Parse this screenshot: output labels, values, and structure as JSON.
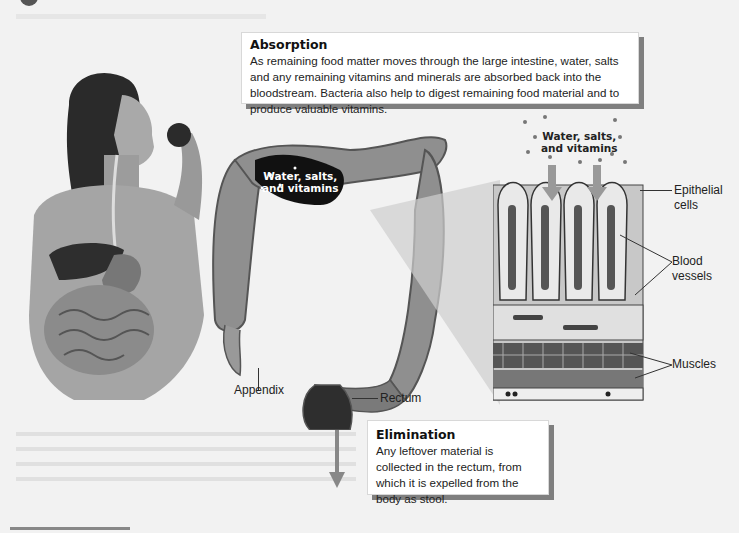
{
  "figure": {
    "absorption": {
      "title": "Absorption",
      "body": "As remaining food matter moves through the large intestine, water, salts and any remaining vitamins and minerals are absorbed back into the bloodstream. Bacteria also help to digest remaining food material and to produce valuable vitamins."
    },
    "elimination": {
      "title": "Elimination",
      "body": "Any leftover material is collected in the rectum, from which it is expelled from the body as stool."
    },
    "labels": {
      "colon_inside": "Water, salts, and vitamins",
      "tissue_top_line1": "Water, salts,",
      "tissue_top_line2": "and vitamins",
      "colon_line1": "Water, salts,",
      "colon_line2": "and vitamins",
      "epithelial_line1": "Epithelial",
      "epithelial_line2": "cells",
      "blood_line1": "Blood",
      "blood_line2": "vessels",
      "muscles": "Muscles",
      "appendix": "Appendix",
      "rectum": "Rectum"
    },
    "illustrations": {
      "woman": "woman-eating-apple-with-digestive-tract",
      "colon": "large-intestine-colon",
      "tissue": "intestinal-wall-cross-section",
      "arrow": "down-arrow"
    },
    "colors": {
      "callout_shadow": "#7f7f7f",
      "background": "#f2f2f2"
    }
  }
}
